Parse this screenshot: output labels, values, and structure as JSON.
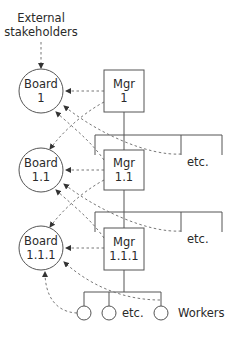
{
  "diagram": {
    "external": {
      "line1": "External",
      "line2": "stakeholders"
    },
    "boards": [
      {
        "line1": "Board",
        "line2": "1"
      },
      {
        "line1": "Board",
        "line2": "1.1"
      },
      {
        "line1": "Board",
        "line2": "1.1.1"
      }
    ],
    "managers": [
      {
        "line1": "Mgr",
        "line2": "1"
      },
      {
        "line1": "Mgr",
        "line2": "1.1"
      },
      {
        "line1": "Mgr",
        "line2": "1.1.1"
      }
    ],
    "etc_labels": [
      "etc.",
      "etc.",
      "etc."
    ],
    "workers_label": "Workers",
    "colors": {
      "line": "#555555",
      "dashed": "#777777",
      "text": "#2a2a2a",
      "background": "#ffffff"
    }
  }
}
